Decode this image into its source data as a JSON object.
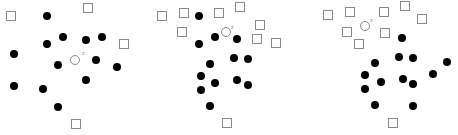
{
  "figure": {
    "colors": {
      "square_stroke": "#8a8a8a",
      "dot_fill": "#000000",
      "query_stroke": "#8a8a8a",
      "label": "#888888"
    },
    "square_size": 9,
    "dot_radius": 4,
    "query_radius": 4.5,
    "panels": [
      {
        "name": "panel-1",
        "query": {
          "x": 75,
          "y": 60,
          "label": "z",
          "label_x": 82,
          "label_y": 55
        },
        "squares": [
          [
            11,
            16
          ],
          [
            88,
            8
          ],
          [
            124,
            44
          ],
          [
            76,
            124
          ]
        ],
        "dots": [
          [
            47,
            16
          ],
          [
            63,
            37
          ],
          [
            86,
            40
          ],
          [
            102,
            37
          ],
          [
            47,
            44
          ],
          [
            14,
            54
          ],
          [
            58,
            65
          ],
          [
            96,
            60
          ],
          [
            117,
            67
          ],
          [
            86,
            80
          ],
          [
            14,
            86
          ],
          [
            43,
            89
          ],
          [
            58,
            107
          ]
        ]
      },
      {
        "name": "panel-2",
        "query": {
          "x": 226,
          "y": 32,
          "label": "z",
          "label_x": 231,
          "label_y": 29
        },
        "squares": [
          [
            162,
            16
          ],
          [
            184,
            13
          ],
          [
            219,
            13
          ],
          [
            240,
            7
          ],
          [
            260,
            25
          ],
          [
            182,
            32
          ],
          [
            257,
            39
          ],
          [
            276,
            43
          ],
          [
            227,
            123
          ]
        ],
        "dots": [
          [
            199,
            16
          ],
          [
            215,
            37
          ],
          [
            237,
            39
          ],
          [
            199,
            44
          ],
          [
            210,
            64
          ],
          [
            234,
            58
          ],
          [
            248,
            59
          ],
          [
            201,
            76
          ],
          [
            215,
            83
          ],
          [
            237,
            80
          ],
          [
            248,
            85
          ],
          [
            201,
            90
          ],
          [
            210,
            106
          ]
        ]
      },
      {
        "name": "panel-3",
        "query": {
          "x": 365,
          "y": 26,
          "label": "z",
          "label_x": 370,
          "label_y": 22
        },
        "squares": [
          [
            328,
            15
          ],
          [
            350,
            12
          ],
          [
            384,
            12
          ],
          [
            405,
            6
          ],
          [
            422,
            19
          ],
          [
            347,
            32
          ],
          [
            385,
            33
          ],
          [
            359,
            44
          ],
          [
            393,
            123
          ]
        ],
        "dots": [
          [
            402,
            38
          ],
          [
            375,
            63
          ],
          [
            399,
            57
          ],
          [
            413,
            58
          ],
          [
            447,
            62
          ],
          [
            365,
            75
          ],
          [
            381,
            82
          ],
          [
            403,
            79
          ],
          [
            413,
            84
          ],
          [
            433,
            74
          ],
          [
            365,
            89
          ],
          [
            375,
            105
          ],
          [
            413,
            106
          ]
        ]
      }
    ]
  }
}
